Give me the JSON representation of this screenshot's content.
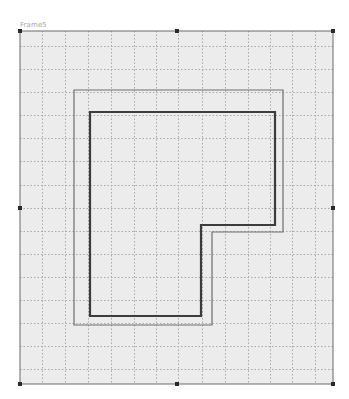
{
  "frame": {
    "label": "Frame5",
    "x": 20,
    "y": 31,
    "width": 313,
    "height": 353,
    "background": "#ececec",
    "border_color": "#6a6a6a"
  },
  "grid": {
    "color": "#a9a9a9",
    "vertical_lines": [
      42,
      65,
      88,
      111,
      134,
      156,
      178,
      202,
      225,
      248,
      270,
      292,
      315
    ],
    "horizontal_lines": [
      46,
      69,
      92,
      115,
      138,
      161,
      185,
      208,
      231,
      254,
      277,
      300,
      323,
      346,
      369
    ]
  },
  "selection_handles": [
    {
      "name": "handle-top-left",
      "x": 20,
      "y": 31
    },
    {
      "name": "handle-top-middle",
      "x": 177,
      "y": 31
    },
    {
      "name": "handle-top-right",
      "x": 333,
      "y": 31
    },
    {
      "name": "handle-middle-left",
      "x": 20,
      "y": 208
    },
    {
      "name": "handle-middle-right",
      "x": 333,
      "y": 208
    },
    {
      "name": "handle-bottom-left",
      "x": 20,
      "y": 384
    },
    {
      "name": "handle-bottom-middle",
      "x": 177,
      "y": 384
    },
    {
      "name": "handle-bottom-right",
      "x": 333,
      "y": 384
    }
  ],
  "shapes": {
    "outer_outline": {
      "points": "74,90 283,90 283,232 212,232 212,325 74,325",
      "stroke": "#6e6e6e",
      "stroke_width": 1.2
    },
    "inner_outline": {
      "points": "90,112 275,112 275,225 201,225 201,316 90,316",
      "stroke": "#3c3c3c",
      "stroke_width": 2.2
    }
  }
}
